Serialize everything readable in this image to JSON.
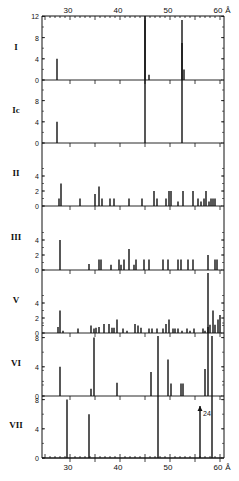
{
  "chart_data": {
    "type": "bar",
    "title": "",
    "xlabel": "Å",
    "x_unit": "Å",
    "xlim": [
      24.4,
      60.5
    ],
    "xticks": [
      30,
      40,
      50,
      60
    ],
    "xtick_labels": [
      "30",
      "40",
      "50",
      "60"
    ],
    "grid": false,
    "legend": null,
    "panels": [
      {
        "label": "I",
        "ylim": [
          0,
          12
        ],
        "yticks": [
          0,
          4,
          8,
          12
        ],
        "bars": [
          {
            "x": 27.4,
            "h": 4
          },
          {
            "x": 45.0,
            "h": 13
          },
          {
            "x": 45.8,
            "h": 1
          },
          {
            "x": 52.4,
            "h": 7
          },
          {
            "x": 52.8,
            "h": 2
          }
        ]
      },
      {
        "label": "Ic",
        "ylim": [
          0,
          10
        ],
        "yticks": [
          0,
          4,
          8
        ],
        "bars": [
          {
            "x": 27.4,
            "h": 4
          },
          {
            "x": 45.0,
            "h": 13
          },
          {
            "x": 52.4,
            "h": 13
          }
        ]
      },
      {
        "label": "II",
        "ylim": [
          0,
          5
        ],
        "yticks": [
          0,
          2,
          4
        ],
        "bars": [
          {
            "x": 27.8,
            "h": 1
          },
          {
            "x": 28.2,
            "h": 3
          },
          {
            "x": 32.0,
            "h": 1
          },
          {
            "x": 35.0,
            "h": 1.6
          },
          {
            "x": 35.8,
            "h": 2.6
          },
          {
            "x": 36.4,
            "h": 1
          },
          {
            "x": 38.0,
            "h": 1
          },
          {
            "x": 38.8,
            "h": 1
          },
          {
            "x": 41.8,
            "h": 1
          },
          {
            "x": 44.4,
            "h": 1
          },
          {
            "x": 46.8,
            "h": 2
          },
          {
            "x": 47.4,
            "h": 1
          },
          {
            "x": 49.2,
            "h": 1
          },
          {
            "x": 49.8,
            "h": 2
          },
          {
            "x": 50.2,
            "h": 2
          },
          {
            "x": 51.6,
            "h": 0.6
          },
          {
            "x": 52.6,
            "h": 2
          },
          {
            "x": 54.6,
            "h": 2
          },
          {
            "x": 55.6,
            "h": 1
          },
          {
            "x": 56.2,
            "h": 0.6
          },
          {
            "x": 56.8,
            "h": 1
          },
          {
            "x": 57.2,
            "h": 2
          },
          {
            "x": 57.8,
            "h": 0.6
          },
          {
            "x": 58.2,
            "h": 1
          },
          {
            "x": 58.6,
            "h": 1
          },
          {
            "x": 59.0,
            "h": 1
          }
        ]
      },
      {
        "label": "III",
        "ylim": [
          0,
          5
        ],
        "yticks": [
          0,
          2,
          4
        ],
        "bars": [
          {
            "x": 28.0,
            "h": 4
          },
          {
            "x": 33.8,
            "h": 0.8
          },
          {
            "x": 35.8,
            "h": 1.4
          },
          {
            "x": 36.2,
            "h": 1.4
          },
          {
            "x": 38.2,
            "h": 0.7
          },
          {
            "x": 39.8,
            "h": 1.4
          },
          {
            "x": 40.2,
            "h": 0.7
          },
          {
            "x": 40.8,
            "h": 1.4
          },
          {
            "x": 41.8,
            "h": 2.8
          },
          {
            "x": 42.8,
            "h": 0.7
          },
          {
            "x": 43.2,
            "h": 1.4
          },
          {
            "x": 44.8,
            "h": 1.4
          },
          {
            "x": 45.8,
            "h": 1.4
          },
          {
            "x": 48.6,
            "h": 1.4
          },
          {
            "x": 49.6,
            "h": 1.4
          },
          {
            "x": 51.6,
            "h": 1.4
          },
          {
            "x": 52.2,
            "h": 1.4
          },
          {
            "x": 53.6,
            "h": 1.4
          },
          {
            "x": 54.6,
            "h": 1.4
          },
          {
            "x": 57.6,
            "h": 2
          },
          {
            "x": 59.0,
            "h": 1.4
          },
          {
            "x": 59.4,
            "h": 1.4
          }
        ]
      },
      {
        "label": "V",
        "ylim": [
          0,
          5
        ],
        "yticks": [
          0,
          2,
          4
        ],
        "bars": [
          {
            "x": 27.6,
            "h": 0.8
          },
          {
            "x": 28.0,
            "h": 3
          },
          {
            "x": 28.6,
            "h": 0.3
          },
          {
            "x": 31.6,
            "h": 0.6
          },
          {
            "x": 34.2,
            "h": 1
          },
          {
            "x": 34.8,
            "h": 0.6
          },
          {
            "x": 35.2,
            "h": 0.7
          },
          {
            "x": 35.8,
            "h": 0.8
          },
          {
            "x": 36.8,
            "h": 1.2
          },
          {
            "x": 37.8,
            "h": 1.2
          },
          {
            "x": 38.4,
            "h": 0.7
          },
          {
            "x": 38.8,
            "h": 0.7
          },
          {
            "x": 39.4,
            "h": 1.8
          },
          {
            "x": 40.6,
            "h": 0.6
          },
          {
            "x": 41.4,
            "h": 0.3
          },
          {
            "x": 43.0,
            "h": 1.2
          },
          {
            "x": 43.6,
            "h": 1
          },
          {
            "x": 44.2,
            "h": 0.7
          },
          {
            "x": 45.8,
            "h": 0.6
          },
          {
            "x": 46.4,
            "h": 0.6
          },
          {
            "x": 47.4,
            "h": 0.6
          },
          {
            "x": 48.6,
            "h": 0.6
          },
          {
            "x": 49.2,
            "h": 1.2
          },
          {
            "x": 49.8,
            "h": 1.8
          },
          {
            "x": 50.6,
            "h": 0.6
          },
          {
            "x": 51.0,
            "h": 0.6
          },
          {
            "x": 51.6,
            "h": 0.6
          },
          {
            "x": 52.4,
            "h": 0.3
          },
          {
            "x": 53.4,
            "h": 0.6
          },
          {
            "x": 54.0,
            "h": 0.3
          },
          {
            "x": 54.8,
            "h": 0.6
          },
          {
            "x": 56.6,
            "h": 0.6
          },
          {
            "x": 57.0,
            "h": 0.3
          },
          {
            "x": 57.6,
            "h": 0.8
          },
          {
            "x": 58.0,
            "h": 1.1
          },
          {
            "x": 58.6,
            "h": 3
          },
          {
            "x": 59.0,
            "h": 1.1
          },
          {
            "x": 59.6,
            "h": 1.8
          },
          {
            "x": 60.0,
            "h": 2.4
          }
        ]
      },
      {
        "label": "VI",
        "ylim": [
          0,
          10
        ],
        "yticks": [
          0,
          4,
          8
        ],
        "bars": [
          {
            "x": 28.0,
            "h": 4
          },
          {
            "x": 34.2,
            "h": 1
          },
          {
            "x": 34.8,
            "h": 8
          },
          {
            "x": 39.4,
            "h": 1.8
          },
          {
            "x": 46.2,
            "h": 3.3
          },
          {
            "x": 49.6,
            "h": 5
          },
          {
            "x": 50.2,
            "h": 1.7
          },
          {
            "x": 52.2,
            "h": 1.7
          },
          {
            "x": 52.6,
            "h": 1.7
          },
          {
            "x": 57.0,
            "h": 3.7
          },
          {
            "x": 57.6,
            "h": 9.7
          }
        ]
      },
      {
        "label": "VII",
        "ylim": [
          0,
          12
        ],
        "yticks": [
          0,
          4,
          8
        ],
        "bars": [
          {
            "x": 29.4,
            "h": 8
          },
          {
            "x": 33.8,
            "h": 6
          },
          {
            "x": 47.6,
            "h": 22
          },
          {
            "x": 56.0,
            "h": 24,
            "arrow": true,
            "annotation": "24"
          },
          {
            "x": 58.4,
            "h": 8.3
          }
        ]
      }
    ]
  }
}
